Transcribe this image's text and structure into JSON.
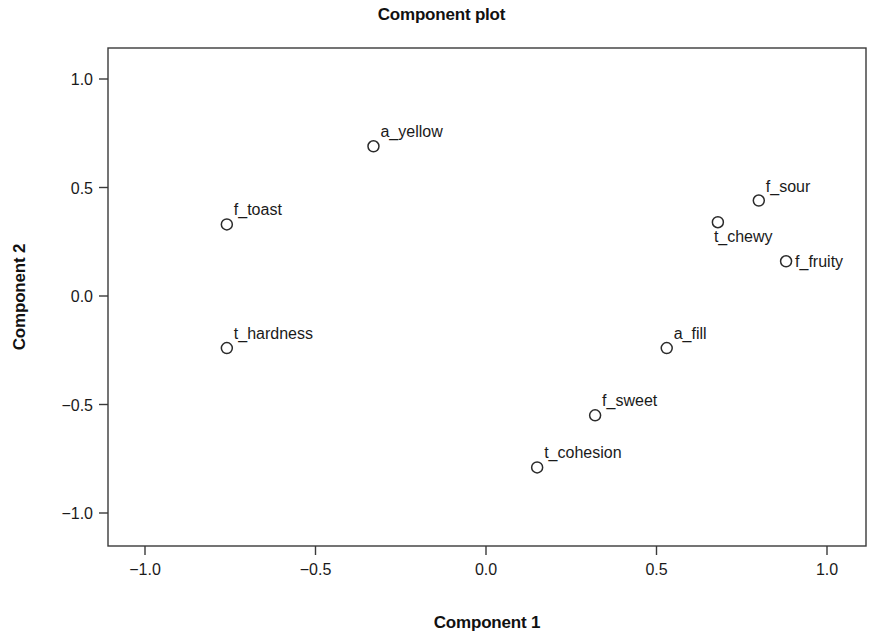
{
  "chart_data": {
    "type": "scatter",
    "title": "Component plot",
    "xlabel": "Component 1",
    "ylabel": "Component 2",
    "xlim": [
      -1.15,
      1.12
    ],
    "ylim": [
      -1.16,
      1.14
    ],
    "xticks": [
      "-1.0",
      "-0.5",
      "0.0",
      "0.5",
      "1.0"
    ],
    "xtick_values": [
      -1.0,
      -0.5,
      0.0,
      0.5,
      1.0
    ],
    "yticks": [
      "1.0",
      "0.5",
      "0.0",
      "-0.5",
      "-1.0"
    ],
    "ytick_values": [
      1.0,
      0.5,
      0.0,
      -0.5,
      -1.0
    ],
    "grid": false,
    "legend": "none",
    "marker": "open-circle",
    "marker_color": "#2b2b2b",
    "points": [
      {
        "label": "a_yellow",
        "x": -0.33,
        "y": 0.69,
        "label_pos": "above-right"
      },
      {
        "label": "f_toast",
        "x": -0.76,
        "y": 0.33,
        "label_pos": "above-right"
      },
      {
        "label": "t_hardness",
        "x": -0.76,
        "y": -0.24,
        "label_pos": "above-right"
      },
      {
        "label": "f_sour",
        "x": 0.8,
        "y": 0.44,
        "label_pos": "above-right"
      },
      {
        "label": "t_chewy",
        "x": 0.68,
        "y": 0.34,
        "label_pos": "below-right"
      },
      {
        "label": "f_fruity",
        "x": 0.88,
        "y": 0.16,
        "label_pos": "right"
      },
      {
        "label": "a_fill",
        "x": 0.53,
        "y": -0.24,
        "label_pos": "above-right"
      },
      {
        "label": "f_sweet",
        "x": 0.32,
        "y": -0.55,
        "label_pos": "above-right"
      },
      {
        "label": "t_cohesion",
        "x": 0.15,
        "y": -0.79,
        "label_pos": "above-right"
      }
    ]
  }
}
